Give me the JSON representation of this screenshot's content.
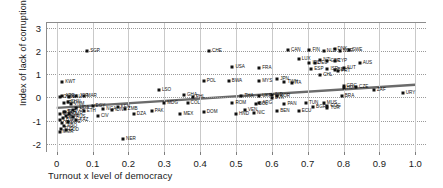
{
  "chart_data": {
    "type": "scatter",
    "title": "",
    "xlabel": "Turnout x level of democracy",
    "ylabel": "Index of lack of corruption",
    "xlim": [
      -0.03,
      1.03
    ],
    "ylim": [
      -2.35,
      3.25
    ],
    "xticks": [
      "0",
      "0.1",
      "0.2",
      "0.3",
      "0.4",
      "0.5",
      "0.6",
      "0.7",
      "0.8",
      "0.9",
      "1.0"
    ],
    "xtick_values": [
      0,
      0.1,
      0.2,
      0.3,
      0.4,
      0.5,
      0.6,
      0.7,
      0.8,
      0.9,
      1.0
    ],
    "yticks": [
      "3",
      "2",
      "1",
      "0",
      "-1",
      "-2"
    ],
    "ytick_values": [
      3,
      2,
      1,
      0,
      -1,
      -2
    ],
    "grid": "both",
    "legend": "none",
    "marker_color": "#111111",
    "fit_line_color": "#6b6b6b",
    "fit_line": {
      "x0": 0.0,
      "y0": -0.45,
      "x1": 1.0,
      "y1": 0.55
    },
    "points": [
      {
        "label": "SGP",
        "x": 0.085,
        "y": 2.0,
        "lx": "right"
      },
      {
        "label": "CHE",
        "x": 0.425,
        "y": 2.0,
        "lx": "right"
      },
      {
        "label": "CAN",
        "x": 0.645,
        "y": 2.05,
        "lx": "right"
      },
      {
        "label": "SWE",
        "x": 0.815,
        "y": 2.05,
        "lx": "right"
      },
      {
        "label": "DNK",
        "x": 0.775,
        "y": 2.1,
        "lx": "right"
      },
      {
        "label": "NOR",
        "x": 0.79,
        "y": 2.0,
        "lx": "right"
      },
      {
        "label": "FIN",
        "x": 0.705,
        "y": 2.05,
        "lx": "right"
      },
      {
        "label": "NLD",
        "x": 0.745,
        "y": 2.0,
        "lx": "right"
      },
      {
        "label": "LUX",
        "x": 0.675,
        "y": 1.65,
        "lx": "right"
      },
      {
        "label": "NZL",
        "x": 0.735,
        "y": 1.6,
        "lx": "right"
      },
      {
        "label": "GBR",
        "x": 0.755,
        "y": 1.58,
        "lx": "right"
      },
      {
        "label": "CYP",
        "x": 0.775,
        "y": 1.55,
        "lx": "right"
      },
      {
        "label": "AUS",
        "x": 0.845,
        "y": 1.5,
        "lx": "right"
      },
      {
        "label": "DEU",
        "x": 0.72,
        "y": 1.5,
        "lx": "right"
      },
      {
        "label": "IRL",
        "x": 0.705,
        "y": 1.5,
        "lx": "right"
      },
      {
        "label": "USA",
        "x": 0.49,
        "y": 1.3,
        "lx": "right"
      },
      {
        "label": "FRA",
        "x": 0.565,
        "y": 1.28,
        "lx": "right"
      },
      {
        "label": "ESP",
        "x": 0.71,
        "y": 1.22,
        "lx": "right"
      },
      {
        "label": "ISR",
        "x": 0.755,
        "y": 1.22,
        "lx": "right"
      },
      {
        "label": "AUT",
        "x": 0.8,
        "y": 1.25,
        "lx": "right"
      },
      {
        "label": "BEL",
        "x": 0.775,
        "y": 1.2,
        "lx": "right"
      },
      {
        "label": "PRT",
        "x": 0.785,
        "y": 1.15,
        "lx": "right"
      },
      {
        "label": "CHL",
        "x": 0.735,
        "y": 0.95,
        "lx": "right"
      },
      {
        "label": "KWT",
        "x": 0.015,
        "y": 0.68,
        "lx": "right"
      },
      {
        "label": "POL",
        "x": 0.41,
        "y": 0.7,
        "lx": "right"
      },
      {
        "label": "BWA",
        "x": 0.48,
        "y": 0.7,
        "lx": "right"
      },
      {
        "label": "MYS",
        "x": 0.565,
        "y": 0.7,
        "lx": "right"
      },
      {
        "label": "JPN",
        "x": 0.615,
        "y": 0.78,
        "lx": "right"
      },
      {
        "label": "TWN",
        "x": 0.635,
        "y": 0.65,
        "lx": "right"
      },
      {
        "label": "ITA",
        "x": 0.655,
        "y": 0.62,
        "lx": "right"
      },
      {
        "label": "GRC",
        "x": 0.8,
        "y": 0.48,
        "lx": "right"
      },
      {
        "label": "CZE",
        "x": 0.835,
        "y": 0.45,
        "lx": "right"
      },
      {
        "label": "HUN",
        "x": 0.8,
        "y": 0.42,
        "lx": "right"
      },
      {
        "label": "ZAF",
        "x": 0.885,
        "y": 0.33,
        "lx": "right"
      },
      {
        "label": "URY",
        "x": 0.965,
        "y": 0.2,
        "lx": "right"
      },
      {
        "label": "LSO",
        "x": 0.285,
        "y": 0.32,
        "lx": "right"
      },
      {
        "label": "GHA",
        "x": 0.355,
        "y": 0.12,
        "lx": "right"
      },
      {
        "label": "PHL",
        "x": 0.38,
        "y": 0.02,
        "lx": "right"
      },
      {
        "label": "THA",
        "x": 0.515,
        "y": 0.08,
        "lx": "right"
      },
      {
        "label": "UKR",
        "x": 0.565,
        "y": 0.08,
        "lx": "right"
      },
      {
        "label": "IND",
        "x": 0.6,
        "y": 0.1,
        "lx": "right"
      },
      {
        "label": "KOR",
        "x": 0.615,
        "y": 0.05,
        "lx": "right"
      },
      {
        "label": "SVK",
        "x": 0.6,
        "y": -0.02,
        "lx": "right"
      },
      {
        "label": "BRA",
        "x": 0.795,
        "y": 0.08,
        "lx": "right"
      },
      {
        "label": "MUS",
        "x": 0.745,
        "y": -0.22,
        "lx": "right"
      },
      {
        "label": "TUR",
        "x": 0.755,
        "y": -0.45,
        "lx": "right"
      },
      {
        "label": "COG",
        "x": 0.755,
        "y": -0.38,
        "lx": "right"
      },
      {
        "label": "MDG",
        "x": 0.3,
        "y": -0.25,
        "lx": "right"
      },
      {
        "label": "COL",
        "x": 0.365,
        "y": -0.25,
        "lx": "right"
      },
      {
        "label": "ROM",
        "x": 0.49,
        "y": -0.25,
        "lx": "right"
      },
      {
        "label": "BOL",
        "x": 0.555,
        "y": -0.3,
        "lx": "right"
      },
      {
        "label": "ARG",
        "x": 0.565,
        "y": -0.25,
        "lx": "right"
      },
      {
        "label": "PAN",
        "x": 0.635,
        "y": -0.3,
        "lx": "right"
      },
      {
        "label": "TUN",
        "x": 0.695,
        "y": -0.25,
        "lx": "right"
      },
      {
        "label": "BGR",
        "x": 0.715,
        "y": -0.42,
        "lx": "right"
      },
      {
        "label": "BEN",
        "x": 0.615,
        "y": -0.58,
        "lx": "right"
      },
      {
        "label": "ECU",
        "x": 0.675,
        "y": -0.6,
        "lx": "right"
      },
      {
        "label": "NIC",
        "x": 0.55,
        "y": -0.65,
        "lx": "right"
      },
      {
        "label": "VEN",
        "x": 0.525,
        "y": -0.55,
        "lx": "right"
      },
      {
        "label": "HND",
        "x": 0.5,
        "y": -0.7,
        "lx": "right"
      },
      {
        "label": "DOM",
        "x": 0.41,
        "y": -0.62,
        "lx": "right"
      },
      {
        "label": "MEX",
        "x": 0.345,
        "y": -0.72,
        "lx": "right"
      },
      {
        "label": "PAK",
        "x": 0.265,
        "y": -0.6,
        "lx": "right"
      },
      {
        "label": "DZA",
        "x": 0.215,
        "y": -0.72,
        "lx": "right"
      },
      {
        "label": "ZMB",
        "x": 0.19,
        "y": -0.5,
        "lx": "right"
      },
      {
        "label": "KEN",
        "x": 0.17,
        "y": -0.42,
        "lx": "right"
      },
      {
        "label": "IDN",
        "x": 0.155,
        "y": -0.55,
        "lx": "right"
      },
      {
        "label": "NGA",
        "x": 0.13,
        "y": -0.5,
        "lx": "right"
      },
      {
        "label": "EGY",
        "x": 0.1,
        "y": -0.35,
        "lx": "right"
      },
      {
        "label": "CIV",
        "x": 0.115,
        "y": -0.78,
        "lx": "right"
      },
      {
        "label": "ETH",
        "x": 0.075,
        "y": -0.6,
        "lx": "right"
      },
      {
        "label": "UGA",
        "x": 0.055,
        "y": -0.45,
        "lx": "right"
      },
      {
        "label": "TZA",
        "x": 0.045,
        "y": -0.55,
        "lx": "right"
      },
      {
        "label": "CMR",
        "x": 0.035,
        "y": -0.7,
        "lx": "right"
      },
      {
        "label": "SDN",
        "x": 0.025,
        "y": -0.82,
        "lx": "right"
      },
      {
        "label": "SYR",
        "x": 0.02,
        "y": -0.62,
        "lx": "right"
      },
      {
        "label": "NER",
        "x": 0.185,
        "y": -1.78,
        "lx": "right"
      },
      {
        "label": "ARE",
        "x": 0.015,
        "y": 0.05,
        "lx": "right"
      },
      {
        "label": "OMN",
        "x": 0.01,
        "y": 0.0,
        "lx": "right"
      },
      {
        "label": "SAU",
        "x": 0.035,
        "y": 0.02,
        "lx": "right"
      },
      {
        "label": "JOR",
        "x": 0.055,
        "y": 0.05,
        "lx": "right"
      },
      {
        "label": "MAR",
        "x": 0.075,
        "y": 0.08,
        "lx": "right"
      },
      {
        "label": "IRN",
        "x": 0.02,
        "y": -0.22,
        "lx": "right"
      },
      {
        "label": "CHN",
        "x": 0.03,
        "y": -0.18,
        "lx": "right"
      },
      {
        "label": "VNM",
        "x": 0.04,
        "y": -0.3,
        "lx": "right"
      },
      {
        "label": "LBY",
        "x": 0.01,
        "y": -0.95,
        "lx": "right"
      },
      {
        "label": "IRQ",
        "x": 0.015,
        "y": -1.12,
        "lx": "right"
      },
      {
        "label": "AGO",
        "x": 0.02,
        "y": -1.25,
        "lx": "right"
      },
      {
        "label": "ZWE",
        "x": 0.03,
        "y": -1.05,
        "lx": "right"
      },
      {
        "label": "TCD",
        "x": 0.012,
        "y": -1.35,
        "lx": "right"
      },
      {
        "label": "COD",
        "x": 0.025,
        "y": -1.42,
        "lx": "right"
      },
      {
        "label": "MMR",
        "x": 0.008,
        "y": -1.5,
        "lx": "right"
      },
      {
        "label": "PRK",
        "x": 0.018,
        "y": -0.88,
        "lx": "right"
      },
      {
        "label": "CUB",
        "x": 0.008,
        "y": -0.72,
        "lx": "right"
      },
      {
        "label": "BLR",
        "x": 0.022,
        "y": -0.62,
        "lx": "right"
      },
      {
        "label": "RUS",
        "x": 0.045,
        "y": -0.85,
        "lx": "right"
      },
      {
        "label": "KAZ",
        "x": 0.055,
        "y": -0.95,
        "lx": "right"
      }
    ]
  }
}
